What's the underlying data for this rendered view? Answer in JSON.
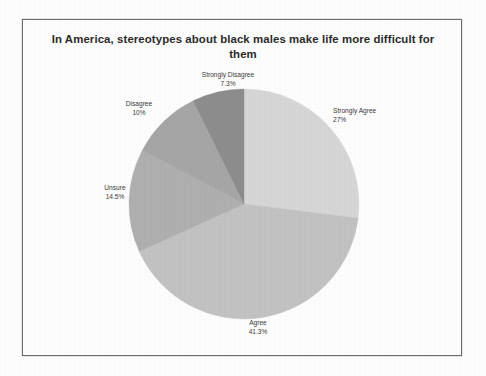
{
  "chart_data": {
    "type": "pie",
    "title": "In America, stereotypes about black males make life more difficult for them",
    "categories": [
      "Strongly Agree",
      "Agree",
      "Unsure",
      "Disagree",
      "Strongly Disagree"
    ],
    "values": [
      27,
      41.3,
      14.5,
      10,
      7.3
    ],
    "value_labels": [
      "27%",
      "41.3%",
      "14.5%",
      "10%",
      "7.3%"
    ],
    "units": "percent",
    "legend": "none",
    "labels_position": "outside-callout",
    "start_angle_deg": 0,
    "direction": "clockwise",
    "slice_colors": [
      "#d7d7d7",
      "#c3c3c3",
      "#b0b0b0",
      "#a6a6a6",
      "#8d8d8d"
    ],
    "slices": [
      {
        "label": "Strongly Agree",
        "value": 27,
        "display": "27%",
        "color": "#d7d7d7"
      },
      {
        "label": "Agree",
        "value": 41.3,
        "display": "41.3%",
        "color": "#c3c3c3"
      },
      {
        "label": "Unsure",
        "value": 14.5,
        "display": "14.5%",
        "color": "#b0b0b0"
      },
      {
        "label": "Disagree",
        "value": 10,
        "display": "10%",
        "color": "#a6a6a6"
      },
      {
        "label": "Strongly Disagree",
        "value": 7.3,
        "display": "7.3%",
        "color": "#8d8d8d"
      }
    ]
  },
  "frame": {
    "border_color": "#6d6d6d",
    "background": "#fefefe"
  }
}
